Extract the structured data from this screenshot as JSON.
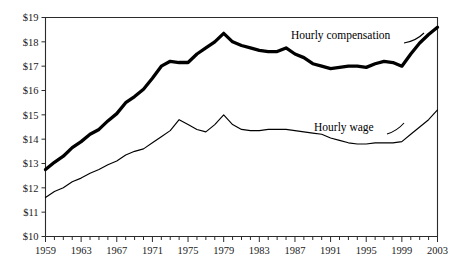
{
  "chart_data": {
    "type": "line",
    "title": "",
    "subtitle": "",
    "xlabel": "",
    "ylabel": "",
    "xlim": [
      1959,
      2003
    ],
    "ylim": [
      10,
      19
    ],
    "grid": false,
    "legend_position": "inline-annotations",
    "y_tick_labels": [
      "$19",
      "$18",
      "$17",
      "$16",
      "$15",
      "$14",
      "$13",
      "$12",
      "$11",
      "$10"
    ],
    "y_tick_values": [
      19,
      18,
      17,
      16,
      15,
      14,
      13,
      12,
      11,
      10
    ],
    "x_tick_labels": [
      "1959",
      "1963",
      "1967",
      "1971",
      "1975",
      "1979",
      "1983",
      "1987",
      "1991",
      "1995",
      "1999",
      "2003"
    ],
    "x_tick_values": [
      1959,
      1963,
      1967,
      1971,
      1975,
      1979,
      1983,
      1987,
      1991,
      1995,
      1999,
      2003
    ],
    "x_minor_tick_step": 1,
    "annotations": [
      {
        "text": "Hourly compensation",
        "series": "Hourly compensation"
      },
      {
        "text": "Hourly wage",
        "series": "Hourly wage"
      }
    ],
    "x": [
      1959,
      1960,
      1961,
      1962,
      1963,
      1964,
      1965,
      1966,
      1967,
      1968,
      1969,
      1970,
      1971,
      1972,
      1973,
      1974,
      1975,
      1976,
      1977,
      1978,
      1979,
      1980,
      1981,
      1982,
      1983,
      1984,
      1985,
      1986,
      1987,
      1988,
      1989,
      1990,
      1991,
      1992,
      1993,
      1994,
      1995,
      1996,
      1997,
      1998,
      1999,
      2000,
      2001,
      2002,
      2003
    ],
    "series": [
      {
        "name": "Hourly compensation",
        "color": "#000000",
        "line_width": "thick",
        "values": [
          12.75,
          13.05,
          13.3,
          13.65,
          13.9,
          14.2,
          14.4,
          14.75,
          15.05,
          15.5,
          15.75,
          16.05,
          16.5,
          17.0,
          17.2,
          17.15,
          17.15,
          17.5,
          17.75,
          18.0,
          18.35,
          18.0,
          17.85,
          17.75,
          17.65,
          17.6,
          17.6,
          17.75,
          17.5,
          17.35,
          17.1,
          17.0,
          16.9,
          16.95,
          17.0,
          17.0,
          16.95,
          17.1,
          17.2,
          17.15,
          17.0,
          17.5,
          17.95,
          18.3,
          18.6
        ]
      },
      {
        "name": "Hourly wage",
        "color": "#000000",
        "line_width": "thin",
        "values": [
          11.6,
          11.85,
          12.0,
          12.25,
          12.4,
          12.6,
          12.75,
          12.95,
          13.1,
          13.35,
          13.5,
          13.6,
          13.85,
          14.1,
          14.35,
          14.8,
          14.6,
          14.4,
          14.3,
          14.6,
          15.0,
          14.6,
          14.4,
          14.35,
          14.35,
          14.4,
          14.4,
          14.4,
          14.35,
          14.3,
          14.25,
          14.2,
          14.05,
          13.95,
          13.85,
          13.8,
          13.8,
          13.85,
          13.85,
          13.85,
          13.9,
          14.2,
          14.5,
          14.8,
          15.2
        ]
      }
    ]
  }
}
